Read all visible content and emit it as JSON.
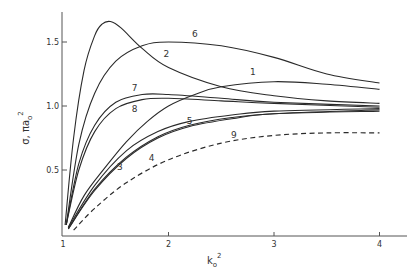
{
  "chart_data": {
    "type": "line",
    "title": "",
    "xlabel": "k_o^2",
    "xlabel_base": "k",
    "xlabel_sub": "o",
    "xlabel_sup": "2",
    "ylabel": "σ, πa_o^2",
    "ylabel_base": "σ, πa",
    "ylabel_sub": "o",
    "ylabel_sup": "2",
    "xlim": [
      1,
      4.3
    ],
    "ylim": [
      0,
      1.73
    ],
    "grid": false,
    "x_ticks": [
      {
        "value": 1,
        "label": "1"
      },
      {
        "value": 2,
        "label": "2"
      },
      {
        "value": 3,
        "label": "3"
      },
      {
        "value": 4,
        "label": "4"
      }
    ],
    "y_ticks": [
      {
        "value": 0.5,
        "label": "0.5"
      },
      {
        "value": 1.0,
        "label": "1.0"
      },
      {
        "value": 1.5,
        "label": "1.5"
      }
    ],
    "series": [
      {
        "name": "1",
        "style": "solid",
        "points": [
          [
            1.05,
            0.05
          ],
          [
            1.2,
            0.3
          ],
          [
            1.4,
            0.52
          ],
          [
            1.6,
            0.72
          ],
          [
            1.8,
            0.88
          ],
          [
            2.0,
            1.0
          ],
          [
            2.25,
            1.09
          ],
          [
            2.5,
            1.15
          ],
          [
            3.0,
            1.19
          ],
          [
            3.5,
            1.17
          ],
          [
            4.0,
            1.13
          ]
        ],
        "label_at": [
          2.8,
          1.24
        ]
      },
      {
        "name": "2",
        "style": "solid",
        "points": [
          [
            1.02,
            0.07
          ],
          [
            1.1,
            0.75
          ],
          [
            1.2,
            1.28
          ],
          [
            1.3,
            1.55
          ],
          [
            1.37,
            1.64
          ],
          [
            1.45,
            1.66
          ],
          [
            1.55,
            1.61
          ],
          [
            1.75,
            1.45
          ],
          [
            2.0,
            1.3
          ],
          [
            2.5,
            1.15
          ],
          [
            3.0,
            1.08
          ],
          [
            3.5,
            1.04
          ],
          [
            4.0,
            1.02
          ]
        ],
        "label_at": [
          1.98,
          1.38
        ]
      },
      {
        "name": "3",
        "style": "solid",
        "points": [
          [
            1.05,
            0.04
          ],
          [
            1.3,
            0.35
          ],
          [
            1.6,
            0.6
          ],
          [
            1.9,
            0.76
          ],
          [
            2.2,
            0.85
          ],
          [
            2.6,
            0.91
          ],
          [
            3.0,
            0.94
          ],
          [
            4.0,
            0.97
          ]
        ],
        "label_at": [
          1.54,
          0.5
        ]
      },
      {
        "name": "4",
        "style": "solid",
        "points": [
          [
            1.05,
            0.04
          ],
          [
            1.3,
            0.34
          ],
          [
            1.6,
            0.59
          ],
          [
            1.9,
            0.75
          ],
          [
            2.2,
            0.84
          ],
          [
            2.6,
            0.9
          ],
          [
            3.0,
            0.94
          ],
          [
            4.0,
            0.96
          ]
        ],
        "label_at": [
          1.84,
          0.57
        ]
      },
      {
        "name": "5",
        "style": "solid",
        "points": [
          [
            1.05,
            0.05
          ],
          [
            1.3,
            0.38
          ],
          [
            1.6,
            0.65
          ],
          [
            1.9,
            0.8
          ],
          [
            2.2,
            0.88
          ],
          [
            2.6,
            0.93
          ],
          [
            3.0,
            0.96
          ],
          [
            4.0,
            0.98
          ]
        ],
        "label_at": [
          2.2,
          0.86
        ]
      },
      {
        "name": "6",
        "style": "solid",
        "points": [
          [
            1.03,
            0.07
          ],
          [
            1.15,
            0.7
          ],
          [
            1.3,
            1.1
          ],
          [
            1.5,
            1.35
          ],
          [
            1.75,
            1.47
          ],
          [
            2.0,
            1.5
          ],
          [
            2.5,
            1.47
          ],
          [
            3.0,
            1.38
          ],
          [
            3.5,
            1.25
          ],
          [
            4.0,
            1.18
          ]
        ],
        "label_at": [
          2.25,
          1.54
        ]
      },
      {
        "name": "7",
        "style": "solid",
        "points": [
          [
            1.03,
            0.07
          ],
          [
            1.15,
            0.55
          ],
          [
            1.3,
            0.85
          ],
          [
            1.5,
            1.03
          ],
          [
            1.75,
            1.09
          ],
          [
            2.0,
            1.09
          ],
          [
            2.5,
            1.06
          ],
          [
            3.0,
            1.03
          ],
          [
            4.0,
            1.0
          ]
        ],
        "label_at": [
          1.68,
          1.12
        ]
      },
      {
        "name": "8",
        "style": "solid",
        "points": [
          [
            1.03,
            0.07
          ],
          [
            1.15,
            0.5
          ],
          [
            1.3,
            0.8
          ],
          [
            1.5,
            0.98
          ],
          [
            1.75,
            1.05
          ],
          [
            2.0,
            1.06
          ],
          [
            2.5,
            1.04
          ],
          [
            3.0,
            1.02
          ],
          [
            4.0,
            0.99
          ]
        ],
        "label_at": [
          1.68,
          0.95
        ]
      },
      {
        "name": "9",
        "style": "dashed",
        "points": [
          [
            1.1,
            0.03
          ],
          [
            1.3,
            0.2
          ],
          [
            1.6,
            0.4
          ],
          [
            2.0,
            0.58
          ],
          [
            2.5,
            0.71
          ],
          [
            3.0,
            0.77
          ],
          [
            3.5,
            0.79
          ],
          [
            4.0,
            0.79
          ]
        ],
        "label_at": [
          2.62,
          0.75
        ]
      }
    ]
  }
}
